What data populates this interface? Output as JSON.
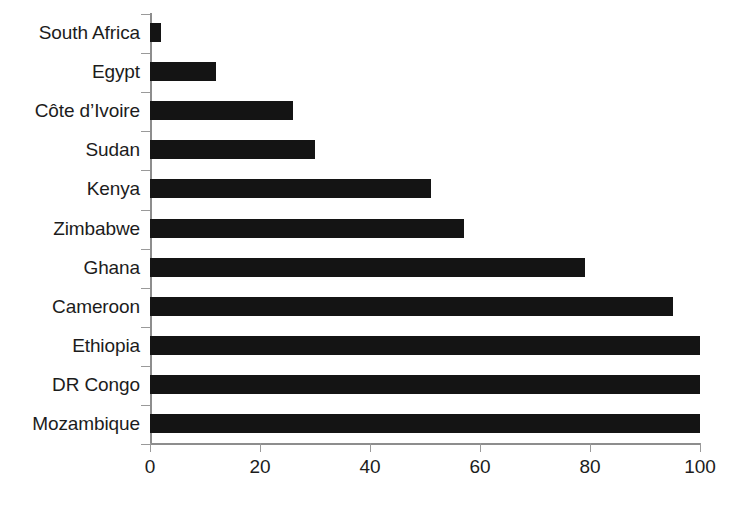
{
  "chart_data": {
    "type": "bar",
    "orientation": "horizontal",
    "title": "",
    "subtitle": "",
    "xlabel": "",
    "ylabel": "",
    "xlim": [
      0,
      100
    ],
    "grid": false,
    "legend": null,
    "bar_color": "#141414",
    "axis_color": "#8d8d8d",
    "categories": [
      "South Africa",
      "Egypt",
      "Côte d’Ivoire",
      "Sudan",
      "Kenya",
      "Zimbabwe",
      "Ghana",
      "Cameroon",
      "Ethiopia",
      "DR Congo",
      "Mozambique"
    ],
    "values": [
      2,
      12,
      26,
      30,
      51,
      57,
      79,
      95,
      100,
      100,
      100
    ],
    "xticks": [
      0,
      20,
      40,
      60,
      80,
      100
    ],
    "xticklabels": [
      "0",
      "20",
      "40",
      "60",
      "80",
      "100"
    ]
  }
}
